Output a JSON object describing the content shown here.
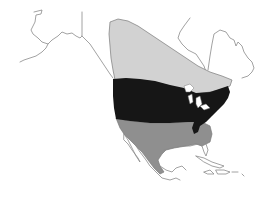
{
  "map": {
    "region": "North America",
    "kind": "species range map",
    "zones": [
      {
        "id": "summer",
        "label": "Breeding (summer) range",
        "color": "#d2d2d2"
      },
      {
        "id": "year_round",
        "label": "Year-round range",
        "color": "#161616"
      },
      {
        "id": "winter",
        "label": "Winter range",
        "color": "#8f8f8f"
      }
    ],
    "coastline_color": "#8a8a8a",
    "background": "#ffffff"
  }
}
